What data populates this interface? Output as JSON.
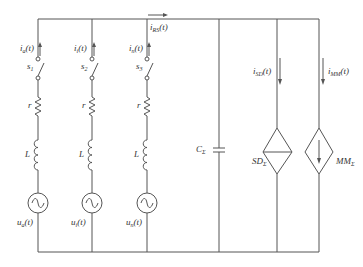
{
  "diagram": {
    "type": "circuit",
    "branches": [
      {
        "current": "i",
        "current_sub": "a",
        "switch": "s",
        "switch_sub": "1",
        "resistor": "r",
        "inductor": "L",
        "source": "u",
        "source_sub": "a"
      },
      {
        "current": "i",
        "current_sub": "i",
        "switch": "s",
        "switch_sub": "2",
        "resistor": "r",
        "inductor": "L",
        "source": "u",
        "source_sub": "i"
      },
      {
        "current": "i",
        "current_sub": "n",
        "switch": "s",
        "switch_sub": "3",
        "resistor": "r",
        "inductor": "L",
        "source": "u",
        "source_sub": "n"
      }
    ],
    "bus_current": {
      "main": "i",
      "sub": "RS",
      "arg": "(t)"
    },
    "capacitor": {
      "main": "C",
      "sub": "Σ"
    },
    "sd": {
      "main": "SD",
      "sub": "Σ",
      "current_main": "i",
      "current_sub": "SD"
    },
    "mm": {
      "main": "MM",
      "sub": "Σ",
      "current_main": "i",
      "current_sub": "MM"
    },
    "time_arg": "(t)"
  }
}
